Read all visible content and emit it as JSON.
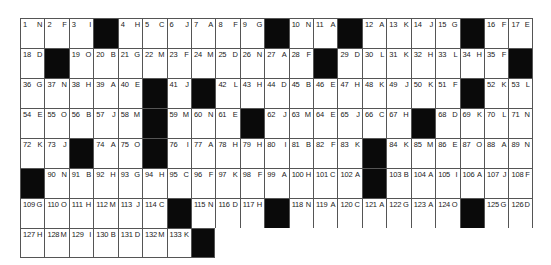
{
  "puzzle": {
    "type": "acrostic-grid",
    "columns": 21,
    "rows": [
      [
        [
          "1",
          "N"
        ],
        [
          "2",
          "F"
        ],
        [
          "3",
          "I"
        ],
        null,
        [
          "4",
          "H"
        ],
        [
          "5",
          "C"
        ],
        [
          "6",
          "J"
        ],
        [
          "7",
          "A"
        ],
        [
          "8",
          "F"
        ],
        [
          "9",
          "G"
        ],
        null,
        [
          "10",
          "N"
        ],
        [
          "11",
          "A"
        ],
        null,
        [
          "12",
          "A"
        ],
        [
          "13",
          "K"
        ],
        [
          "14",
          "J"
        ],
        [
          "15",
          "G"
        ],
        null,
        [
          "16",
          "F"
        ],
        [
          "17",
          "E"
        ]
      ],
      [
        [
          "18",
          "D"
        ],
        null,
        [
          "19",
          "O"
        ],
        [
          "20",
          "B"
        ],
        [
          "21",
          "G"
        ],
        [
          "22",
          "M"
        ],
        [
          "23",
          "F"
        ],
        [
          "24",
          "M"
        ],
        [
          "25",
          "D"
        ],
        [
          "26",
          "N"
        ],
        [
          "27",
          "A"
        ],
        [
          "28",
          "F"
        ],
        null,
        [
          "29",
          "D"
        ],
        [
          "30",
          "L"
        ],
        [
          "31",
          "K"
        ],
        [
          "32",
          "H"
        ],
        [
          "33",
          "L"
        ],
        [
          "34",
          "H"
        ],
        [
          "35",
          "F"
        ],
        null
      ],
      [
        [
          "36",
          "G"
        ],
        [
          "37",
          "N"
        ],
        [
          "38",
          "H"
        ],
        [
          "39",
          "A"
        ],
        [
          "40",
          "E"
        ],
        null,
        [
          "41",
          "J"
        ],
        null,
        [
          "42",
          "L"
        ],
        [
          "43",
          "H"
        ],
        [
          "44",
          "D"
        ],
        [
          "45",
          "B"
        ],
        [
          "46",
          "E"
        ],
        [
          "47",
          "H"
        ],
        [
          "48",
          "K"
        ],
        [
          "49",
          "J"
        ],
        [
          "50",
          "K"
        ],
        [
          "51",
          "F"
        ],
        null,
        [
          "52",
          "K"
        ],
        [
          "53",
          "L"
        ]
      ],
      [
        [
          "54",
          "E"
        ],
        [
          "55",
          "O"
        ],
        [
          "56",
          "B"
        ],
        [
          "57",
          "J"
        ],
        [
          "58",
          "M"
        ],
        null,
        [
          "59",
          "M"
        ],
        [
          "60",
          "N"
        ],
        [
          "61",
          "E"
        ],
        null,
        [
          "62",
          "J"
        ],
        [
          "63",
          "M"
        ],
        [
          "64",
          "E"
        ],
        [
          "65",
          "J"
        ],
        [
          "66",
          "C"
        ],
        [
          "67",
          "H"
        ],
        null,
        [
          "68",
          "D"
        ],
        [
          "69",
          "K"
        ],
        [
          "70",
          "L"
        ],
        [
          "71",
          "N"
        ]
      ],
      [
        [
          "72",
          "K"
        ],
        [
          "73",
          "J"
        ],
        null,
        [
          "74",
          "A"
        ],
        [
          "75",
          "O"
        ],
        null,
        [
          "76",
          "I"
        ],
        [
          "77",
          "A"
        ],
        [
          "78",
          "H"
        ],
        [
          "79",
          "H"
        ],
        [
          "80",
          "I"
        ],
        [
          "81",
          "B"
        ],
        [
          "82",
          "F"
        ],
        [
          "83",
          "K"
        ],
        null,
        [
          "84",
          "K"
        ],
        [
          "85",
          "M"
        ],
        [
          "86",
          "E"
        ],
        [
          "87",
          "O"
        ],
        [
          "88",
          "A"
        ],
        [
          "89",
          "N"
        ]
      ],
      [
        null,
        [
          "90",
          "N"
        ],
        [
          "91",
          "B"
        ],
        [
          "92",
          "H"
        ],
        [
          "93",
          "G"
        ],
        [
          "94",
          "H"
        ],
        [
          "95",
          "C"
        ],
        [
          "96",
          "F"
        ],
        [
          "97",
          "K"
        ],
        [
          "98",
          "F"
        ],
        [
          "99",
          "A"
        ],
        [
          "100",
          "H"
        ],
        [
          "101",
          "C"
        ],
        [
          "102",
          "A"
        ],
        null,
        [
          "103",
          "B"
        ],
        [
          "104",
          "A"
        ],
        [
          "105",
          "I"
        ],
        [
          "106",
          "A"
        ],
        [
          "107",
          "J"
        ],
        [
          "108",
          "F"
        ]
      ],
      [
        [
          "109",
          "G"
        ],
        [
          "110",
          "O"
        ],
        [
          "111",
          "H"
        ],
        [
          "112",
          "M"
        ],
        [
          "113",
          "J"
        ],
        [
          "114",
          "C"
        ],
        null,
        [
          "115",
          "N"
        ],
        [
          "116",
          "D"
        ],
        [
          "117",
          "H"
        ],
        null,
        [
          "118",
          "N"
        ],
        [
          "119",
          "A"
        ],
        [
          "120",
          "C"
        ],
        [
          "121",
          "A"
        ],
        [
          "122",
          "G"
        ],
        [
          "123",
          "A"
        ],
        [
          "124",
          "O"
        ],
        null,
        [
          "125",
          "G"
        ],
        [
          "126",
          "D"
        ]
      ],
      [
        [
          "127",
          "H"
        ],
        [
          "128",
          "M"
        ],
        [
          "129",
          "I"
        ],
        [
          "130",
          "B"
        ],
        [
          "131",
          "D"
        ],
        [
          "132",
          "M"
        ],
        [
          "133",
          "K"
        ],
        null
      ]
    ]
  }
}
